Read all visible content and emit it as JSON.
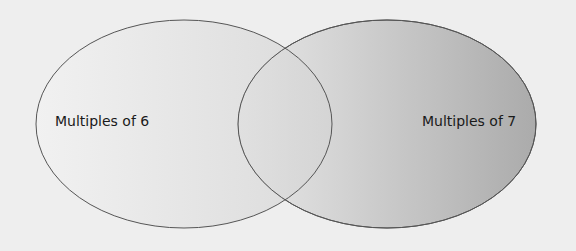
{
  "diagram": {
    "type": "venn",
    "sets": [
      {
        "id": "left",
        "label": "Multiples of 6"
      },
      {
        "id": "right",
        "label": "Multiples of 7"
      }
    ],
    "colors": {
      "background": "#eeeeee",
      "outline": "#555555",
      "left_fill_start": "#f2f2f2",
      "left_fill_end": "#d6d6d6",
      "right_fill_start": "#e6e6e6",
      "right_fill_end": "#b0b0b0"
    }
  }
}
